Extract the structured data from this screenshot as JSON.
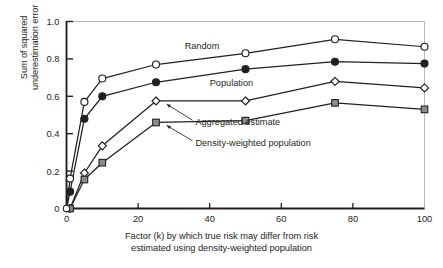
{
  "chart_data": {
    "type": "line",
    "title": "",
    "subtitle": "",
    "xlabel_line1": "Factor (k) by which true risk may differ from risk",
    "xlabel_line2": "estimated using density-weighted population",
    "ylabel_line1": "Sum of squared",
    "ylabel_line2": "underestimation error",
    "xlim": [
      0,
      100
    ],
    "ylim": [
      0,
      1.0
    ],
    "xticks": [
      0,
      20,
      40,
      60,
      80,
      100
    ],
    "xtick_labels": [
      "0",
      "20",
      "40",
      "60",
      "80",
      "100"
    ],
    "yticks": [
      0,
      0.2,
      0.4,
      0.6,
      0.8,
      1.0
    ],
    "ytick_labels": [
      "0",
      "0.2",
      "0.4",
      "0.6",
      "0.8",
      "1.0"
    ],
    "grid": false,
    "legend_position": "inline-annotations",
    "x": [
      0,
      1,
      5,
      10,
      25,
      50,
      75,
      100
    ],
    "series": [
      {
        "name": "Random",
        "marker": "open-circle",
        "color": "#231f20",
        "fill": "#ffffff",
        "values": [
          0.0,
          0.16,
          0.57,
          0.695,
          0.77,
          0.83,
          0.905,
          0.865
        ]
      },
      {
        "name": "Population",
        "marker": "filled-circle",
        "color": "#231f20",
        "fill": "#231f20",
        "values": [
          0.0,
          0.09,
          0.48,
          0.6,
          0.675,
          0.745,
          0.785,
          0.775
        ]
      },
      {
        "name": "Aggregated estimate",
        "marker": "open-diamond",
        "color": "#231f20",
        "fill": "#ffffff",
        "values": [
          0.0,
          0.0,
          0.19,
          0.335,
          0.575,
          0.575,
          0.68,
          0.645
        ]
      },
      {
        "name": "Density-weighted population",
        "marker": "filled-square",
        "color": "#231f20",
        "fill": "#8c8c8c",
        "values": [
          0.0,
          0.0,
          0.155,
          0.245,
          0.46,
          0.47,
          0.565,
          0.53
        ]
      }
    ],
    "annotations": [
      {
        "text": "Random",
        "x": 33,
        "y": 0.855,
        "anchor": "start",
        "arrow": false
      },
      {
        "text": "Population",
        "x": 40,
        "y": 0.655,
        "anchor": "start",
        "arrow": false
      },
      {
        "text": "Aggregated estimate",
        "x": 36,
        "y": 0.445,
        "anchor": "start",
        "arrow": true
      },
      {
        "text": "Density-weighted population",
        "x": 36,
        "y": 0.335,
        "anchor": "start",
        "arrow": true
      }
    ]
  }
}
